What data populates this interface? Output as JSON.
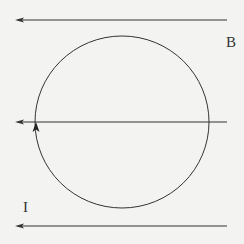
{
  "diagram": {
    "title": "",
    "labels": {
      "field": "B",
      "current": "I"
    },
    "field_lines": [
      {
        "name": "top",
        "y": 20,
        "x_start": 227,
        "x_end": 16,
        "direction": "left"
      },
      {
        "name": "middle",
        "y": 122,
        "x_start": 227,
        "x_end": 16,
        "direction": "left"
      },
      {
        "name": "bottom",
        "y": 226,
        "x_start": 227,
        "x_end": 16,
        "direction": "left"
      }
    ],
    "loop": {
      "cx": 122,
      "cy": 122,
      "rx": 87,
      "ry": 86,
      "current_direction": "counterclockwise (upward on left side)"
    },
    "colors": {
      "background": "#f3f3f1",
      "line": "#333333"
    }
  }
}
